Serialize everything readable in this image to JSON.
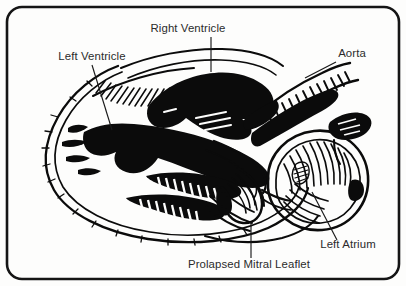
{
  "figure": {
    "kind": "anatomical-illustration",
    "style": "black-and-white line drawing with hatching",
    "frame": {
      "shape": "rounded-rectangle",
      "stroke_color": "#151515",
      "background_color": "#fdfdfc"
    },
    "labels": [
      {
        "id": "right-ventricle",
        "text": "Right Ventricle",
        "x": 188,
        "y": 32,
        "anchor": "middle",
        "leader": {
          "x1": 211,
          "y1": 37,
          "x2": 211,
          "y2": 72
        }
      },
      {
        "id": "left-ventricle",
        "text": "Left Ventricle",
        "x": 92,
        "y": 60,
        "anchor": "middle",
        "leader": {
          "x1": 92,
          "y1": 65,
          "x2": 112,
          "y2": 130
        }
      },
      {
        "id": "aorta",
        "text": "Aorta",
        "x": 352,
        "y": 57,
        "anchor": "middle",
        "leader": {
          "x1": 336,
          "y1": 62,
          "x2": 305,
          "y2": 78
        }
      },
      {
        "id": "left-atrium",
        "text": "Left Atrium",
        "x": 348,
        "y": 248,
        "anchor": "middle",
        "leader": {
          "x1": 337,
          "y1": 240,
          "x2": 312,
          "y2": 192
        }
      },
      {
        "id": "prolapsed-mitral-leaflet",
        "text": "Prolapsed Mitral Leaflet",
        "x": 249,
        "y": 268,
        "anchor": "middle",
        "leader": {
          "x1": 251,
          "y1": 258,
          "x2": 251,
          "y2": 222
        }
      }
    ],
    "colors": {
      "ink": "#0b0b0b",
      "label_text": "#2b2b2b",
      "frame": "#151515",
      "paper": "#fdfdfc"
    }
  }
}
